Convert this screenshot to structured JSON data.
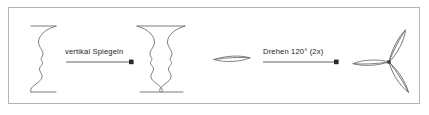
{
  "figure": {
    "title": "",
    "background_color": "#ffffff",
    "border_color": "#b4b4b4",
    "stroke_color": "#6e6e6e",
    "arrow_color": "#3c3c3c",
    "text_color": "#1a1a1a",
    "frame": {
      "x": 8,
      "y": 7,
      "width": 412,
      "height": 97
    }
  },
  "steps": [
    {
      "id": "step-mirror",
      "label": "vertikal Spiegeln",
      "source_shape": "face-profile-outline",
      "result_shape": "rubin-vase-outline",
      "arrow": {
        "x1": 66,
        "y1": 62,
        "x2": 132,
        "y2": 62
      }
    },
    {
      "id": "step-rotate",
      "label": "Drehen 120° (2x)",
      "source_shape": "single-blade-lens",
      "result_shape": "three-blade-rotor",
      "arrow": {
        "x1": 263,
        "y1": 62,
        "x2": 337,
        "y2": 62
      }
    }
  ],
  "shapes": {
    "face_profile": {
      "name": "face-profile-outline",
      "description": "left-facing human profile silhouette, half of a Rubin vase"
    },
    "rubin_vase": {
      "name": "rubin-vase-outline",
      "description": "goblet formed by mirroring the face profile vertically"
    },
    "blade": {
      "name": "single-blade-lens",
      "description": "thin horizontal lens-shaped rotor blade"
    },
    "rotor": {
      "name": "three-blade-rotor",
      "description": "three lens blades spaced 120 degrees around a central hub"
    }
  },
  "icons": {
    "arrow": "arrow-right-icon"
  }
}
